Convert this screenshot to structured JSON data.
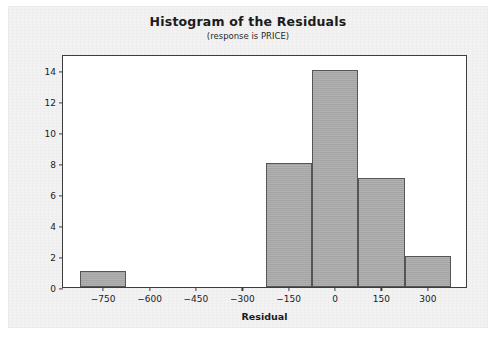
{
  "chart_data": {
    "type": "bar",
    "title": "Histogram of the Residuals",
    "subtitle": "(response is PRICE)",
    "xlabel": "Residual",
    "ylabel": "Frequency",
    "bin_width": 150,
    "categories": [
      "-750",
      "-600",
      "-450",
      "-300",
      "-150",
      "0",
      "150",
      "300"
    ],
    "bins": [
      {
        "center": -750,
        "left": -825,
        "right": -675,
        "value": 1
      },
      {
        "center": -600,
        "left": -675,
        "right": -525,
        "value": 0
      },
      {
        "center": -450,
        "left": -525,
        "right": -375,
        "value": 0
      },
      {
        "center": -300,
        "left": -375,
        "right": -225,
        "value": 0
      },
      {
        "center": -150,
        "left": -225,
        "right": -75,
        "value": 8
      },
      {
        "center": 0,
        "left": -75,
        "right": 75,
        "value": 14
      },
      {
        "center": 150,
        "left": 75,
        "right": 225,
        "value": 7
      },
      {
        "center": 300,
        "left": 225,
        "right": 375,
        "value": 2
      }
    ],
    "values": [
      1,
      0,
      0,
      0,
      8,
      14,
      7,
      2
    ],
    "xticks": [
      -750,
      -600,
      -450,
      -300,
      -150,
      0,
      150,
      300
    ],
    "xtick_labels": [
      "-750",
      "-600",
      "-450",
      "-300",
      "-150",
      "0",
      "150",
      "300"
    ],
    "yticks": [
      0,
      2,
      4,
      6,
      8,
      10,
      12,
      14
    ],
    "ytick_labels": [
      "0",
      "2",
      "4",
      "6",
      "8",
      "10",
      "12",
      "14"
    ],
    "xlim": [
      -880,
      430
    ],
    "ylim": [
      0,
      15
    ],
    "grid": false,
    "legend": null,
    "colors": {
      "bar_fill": "#a9a9a9",
      "bar_edge": "#555555",
      "frame": "#3d3d3d",
      "plot_background": "#ffffff",
      "figure_background": "#f2f2f2",
      "text": "#1b1b1b"
    }
  }
}
